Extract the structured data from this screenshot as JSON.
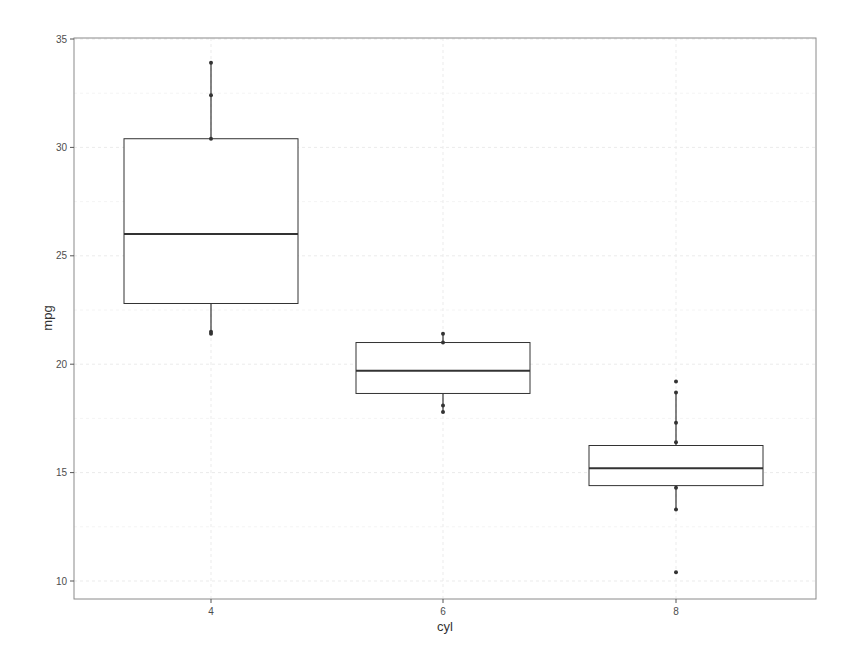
{
  "chart_data": {
    "type": "boxplot",
    "title": "",
    "xlabel": "cyl",
    "ylabel": "mpg",
    "categories": [
      "4",
      "6",
      "8"
    ],
    "ylim": [
      9.3,
      35
    ],
    "yticks": [
      10,
      15,
      20,
      25,
      30,
      35
    ],
    "grid": true,
    "legend": "none",
    "boxes": [
      {
        "category": "4",
        "q1": 22.8,
        "median": 26.0,
        "q3": 30.4,
        "whisker_low": 21.4,
        "whisker_high": 33.9,
        "points": [
          33.9,
          32.4,
          30.4,
          21.5,
          21.4
        ]
      },
      {
        "category": "6",
        "q1": 18.65,
        "median": 19.7,
        "q3": 21.0,
        "whisker_low": 17.8,
        "whisker_high": 21.4,
        "points": [
          21.4,
          21.0,
          18.1,
          17.8
        ]
      },
      {
        "category": "8",
        "q1": 14.4,
        "median": 15.2,
        "q3": 16.25,
        "whisker_low": 13.3,
        "whisker_high": 18.7,
        "points": [
          19.2,
          18.7,
          17.3,
          16.4,
          14.3,
          13.3,
          10.4
        ]
      }
    ]
  },
  "axes": {
    "x_title": "cyl",
    "y_title": "mpg",
    "x_ticks": [
      "4",
      "6",
      "8"
    ],
    "y_ticks": [
      "10",
      "15",
      "20",
      "25",
      "30",
      "35"
    ]
  },
  "colors": {
    "box_stroke": "#333333",
    "grid": "#ebebeb",
    "panel_border": "#7f7f7f",
    "text": "#4d4d4d"
  }
}
